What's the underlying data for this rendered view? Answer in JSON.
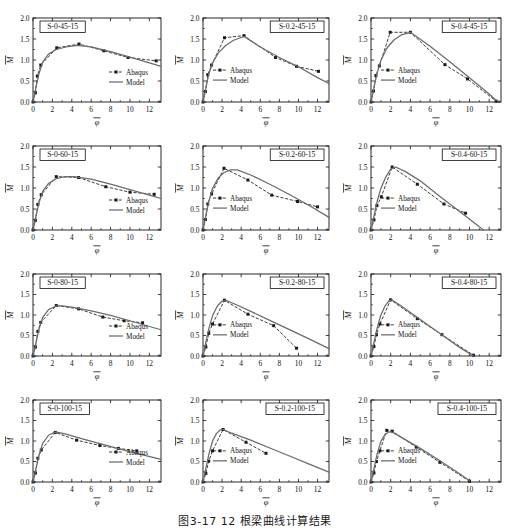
{
  "figure": {
    "caption": "图3-17  12 根梁曲线计算结果",
    "axis": {
      "x_label": "φ",
      "y_label": "M",
      "x_ticks": [
        0,
        2,
        4,
        6,
        8,
        10,
        12
      ],
      "y_ticks": [
        "0.0",
        "0.5",
        "1.0",
        "1.5",
        "2.0"
      ],
      "xlim": [
        0,
        13.2
      ],
      "ylim": [
        0,
        2.0
      ]
    },
    "legend": {
      "abaqus_label": "Abaqus",
      "model_label": "Model"
    },
    "colors": {
      "abaqus": "#1a1a1a",
      "model": "#6b6b6b",
      "axis": "#111111",
      "frame": "#111111"
    }
  },
  "chart_data": [
    {
      "type": "line",
      "title": "S-0-45-15",
      "xlabel": "φ",
      "ylabel": "M",
      "xlim": [
        0,
        13.2
      ],
      "ylim": [
        0,
        2.0
      ],
      "grid": false,
      "legend_position": "bottom-right",
      "series": [
        {
          "name": "Abaqus",
          "style": "dashed-markers",
          "x": [
            0.0,
            0.25,
            0.45,
            0.8,
            2.45,
            4.75,
            7.3,
            9.8,
            12.7
          ],
          "y": [
            0.0,
            0.22,
            0.62,
            0.88,
            1.29,
            1.38,
            1.22,
            1.06,
            0.98
          ]
        },
        {
          "name": "Model",
          "style": "solid",
          "x": [
            0.0,
            0.3,
            0.6,
            1.0,
            1.6,
            2.4,
            3.4,
            4.6,
            6.0,
            8.0,
            10.0,
            12.0,
            13.2
          ],
          "y": [
            0.0,
            0.34,
            0.66,
            0.95,
            1.14,
            1.25,
            1.31,
            1.35,
            1.31,
            1.2,
            1.07,
            0.93,
            0.85
          ]
        }
      ]
    },
    {
      "type": "line",
      "title": "S-0.2-45-15",
      "xlabel": "φ",
      "ylabel": "M",
      "xlim": [
        0,
        13.2
      ],
      "ylim": [
        0,
        2.0
      ],
      "grid": false,
      "legend_position": "center-left",
      "series": [
        {
          "name": "Abaqus",
          "style": "dashed-markers",
          "x": [
            0.0,
            0.25,
            0.5,
            0.9,
            2.25,
            4.3,
            7.6,
            9.8,
            12.1
          ],
          "y": [
            0.0,
            0.25,
            0.65,
            0.88,
            1.53,
            1.58,
            1.06,
            0.85,
            0.73
          ]
        },
        {
          "name": "Model",
          "style": "solid",
          "x": [
            0.0,
            0.3,
            0.6,
            1.0,
            1.6,
            2.4,
            3.2,
            4.3,
            6.0,
            8.0,
            10.0,
            12.0,
            13.2
          ],
          "y": [
            0.0,
            0.33,
            0.66,
            0.93,
            1.17,
            1.35,
            1.47,
            1.56,
            1.31,
            1.06,
            0.84,
            0.58,
            0.44
          ]
        }
      ]
    },
    {
      "type": "line",
      "title": "S-0.4-45-15",
      "xlabel": "φ",
      "ylabel": "M",
      "xlim": [
        0,
        13.2
      ],
      "ylim": [
        0,
        2.0
      ],
      "grid": false,
      "legend_position": "center-left",
      "series": [
        {
          "name": "Abaqus",
          "style": "dashed-markers",
          "x": [
            0.0,
            0.25,
            0.5,
            0.85,
            1.95,
            4.0,
            7.5,
            9.8,
            12.7
          ],
          "y": [
            0.0,
            0.26,
            0.63,
            0.86,
            1.66,
            1.66,
            0.89,
            0.55,
            0.02
          ]
        },
        {
          "name": "Model",
          "style": "solid",
          "x": [
            0.0,
            0.3,
            0.6,
            1.0,
            1.6,
            2.3,
            3.1,
            4.0,
            6.0,
            8.0,
            10.0,
            12.0,
            12.7
          ],
          "y": [
            0.0,
            0.34,
            0.67,
            0.99,
            1.28,
            1.47,
            1.6,
            1.66,
            1.33,
            0.96,
            0.58,
            0.19,
            0.04
          ]
        }
      ]
    },
    {
      "type": "line",
      "title": "S-0-60-15",
      "xlabel": "φ",
      "ylabel": "M",
      "xlim": [
        0,
        13.2
      ],
      "ylim": [
        0,
        2.0
      ],
      "grid": false,
      "legend_position": "bottom-right",
      "series": [
        {
          "name": "Abaqus",
          "style": "dashed-markers",
          "x": [
            0.0,
            0.25,
            0.5,
            0.85,
            2.4,
            4.7,
            7.5,
            10.0,
            12.5
          ],
          "y": [
            0.0,
            0.23,
            0.61,
            0.84,
            1.27,
            1.25,
            1.03,
            0.9,
            0.85
          ]
        },
        {
          "name": "Model",
          "style": "solid",
          "x": [
            0.0,
            0.3,
            0.6,
            1.0,
            1.6,
            2.4,
            3.3,
            4.2,
            6.0,
            8.0,
            10.0,
            12.0,
            13.2
          ],
          "y": [
            0.0,
            0.32,
            0.63,
            0.92,
            1.11,
            1.22,
            1.27,
            1.27,
            1.21,
            1.09,
            0.96,
            0.83,
            0.75
          ]
        }
      ]
    },
    {
      "type": "line",
      "title": "S-0.2-60-15",
      "xlabel": "φ",
      "ylabel": "M",
      "xlim": [
        0,
        13.2
      ],
      "ylim": [
        0,
        2.0
      ],
      "grid": false,
      "legend_position": "center-left",
      "series": [
        {
          "name": "Abaqus",
          "style": "dashed-markers",
          "x": [
            0.0,
            0.25,
            0.5,
            0.9,
            2.2,
            4.7,
            7.2,
            9.9,
            12.0
          ],
          "y": [
            0.0,
            0.25,
            0.62,
            0.86,
            1.47,
            1.19,
            0.83,
            0.68,
            0.55
          ]
        },
        {
          "name": "Model",
          "style": "solid",
          "x": [
            0.0,
            0.3,
            0.6,
            1.0,
            1.6,
            2.2,
            2.9,
            3.6,
            5.0,
            7.0,
            9.0,
            11.0,
            13.2
          ],
          "y": [
            0.0,
            0.34,
            0.67,
            0.99,
            1.24,
            1.37,
            1.43,
            1.43,
            1.31,
            1.09,
            0.85,
            0.6,
            0.3
          ]
        }
      ]
    },
    {
      "type": "line",
      "title": "S-0.4-60-15",
      "xlabel": "φ",
      "ylabel": "M",
      "xlim": [
        0,
        13.2
      ],
      "ylim": [
        0,
        2.0
      ],
      "grid": false,
      "legend_position": "center-left",
      "series": [
        {
          "name": "Abaqus",
          "style": "dashed-markers",
          "x": [
            0.0,
            0.3,
            0.6,
            1.05,
            2.15,
            4.7,
            7.4,
            9.6
          ],
          "y": [
            0.0,
            0.24,
            0.58,
            0.79,
            1.5,
            1.09,
            0.62,
            0.4
          ]
        },
        {
          "name": "Model",
          "style": "solid",
          "x": [
            0.0,
            0.3,
            0.6,
            1.0,
            1.5,
            2.0,
            2.5,
            3.5,
            5.0,
            7.0,
            9.0,
            11.0,
            11.4
          ],
          "y": [
            0.0,
            0.33,
            0.66,
            0.99,
            1.26,
            1.45,
            1.5,
            1.39,
            1.17,
            0.8,
            0.44,
            0.08,
            0.0
          ]
        }
      ]
    },
    {
      "type": "line",
      "title": "S-0-80-15",
      "xlabel": "φ",
      "ylabel": "M",
      "xlim": [
        0,
        13.2
      ],
      "ylim": [
        0,
        2.0
      ],
      "grid": false,
      "legend_position": "bottom-right",
      "series": [
        {
          "name": "Abaqus",
          "style": "dashed-markers",
          "x": [
            0.0,
            0.25,
            0.5,
            0.8,
            2.4,
            4.7,
            7.2,
            9.4,
            11.3
          ],
          "y": [
            0.0,
            0.22,
            0.6,
            0.82,
            1.23,
            1.15,
            0.95,
            0.86,
            0.81
          ]
        },
        {
          "name": "Model",
          "style": "solid",
          "x": [
            0.0,
            0.3,
            0.6,
            1.0,
            1.6,
            2.4,
            3.0,
            4.0,
            6.0,
            8.0,
            10.0,
            12.0,
            13.2
          ],
          "y": [
            0.0,
            0.32,
            0.64,
            0.94,
            1.13,
            1.22,
            1.22,
            1.19,
            1.1,
            0.99,
            0.86,
            0.72,
            0.64
          ]
        }
      ]
    },
    {
      "type": "line",
      "title": "S-0.2-80-15",
      "xlabel": "φ",
      "ylabel": "M",
      "xlim": [
        0,
        13.2
      ],
      "ylim": [
        0,
        2.0
      ],
      "grid": false,
      "legend_position": "center-left",
      "series": [
        {
          "name": "Abaqus",
          "style": "dashed-markers",
          "x": [
            0.0,
            0.3,
            0.6,
            1.0,
            2.25,
            4.7,
            7.4,
            9.8
          ],
          "y": [
            0.0,
            0.22,
            0.55,
            0.78,
            1.36,
            1.02,
            0.74,
            0.19
          ]
        },
        {
          "name": "Model",
          "style": "solid",
          "x": [
            0.0,
            0.3,
            0.6,
            1.0,
            1.5,
            2.0,
            2.4,
            3.5,
            5.0,
            7.0,
            9.0,
            11.0,
            13.2
          ],
          "y": [
            0.0,
            0.33,
            0.66,
            0.98,
            1.22,
            1.34,
            1.36,
            1.25,
            1.09,
            0.87,
            0.65,
            0.43,
            0.18
          ]
        }
      ]
    },
    {
      "type": "line",
      "title": "S-0.4-80-15",
      "xlabel": "φ",
      "ylabel": "M",
      "xlim": [
        0,
        13.2
      ],
      "ylim": [
        0,
        2.0
      ],
      "grid": false,
      "legend_position": "center-left",
      "series": [
        {
          "name": "Abaqus",
          "style": "dashed-markers",
          "x": [
            0.0,
            0.3,
            0.55,
            0.9,
            2.0,
            4.7,
            7.2,
            10.4
          ],
          "y": [
            0.0,
            0.23,
            0.52,
            0.78,
            1.37,
            0.91,
            0.52,
            0.02
          ]
        },
        {
          "name": "Model",
          "style": "solid",
          "x": [
            0.0,
            0.3,
            0.6,
            1.0,
            1.4,
            1.8,
            2.1,
            3.0,
            5.0,
            7.0,
            9.0,
            10.4
          ],
          "y": [
            0.0,
            0.33,
            0.66,
            1.0,
            1.21,
            1.34,
            1.37,
            1.23,
            0.89,
            0.55,
            0.21,
            0.0
          ]
        }
      ]
    },
    {
      "type": "line",
      "title": "S-0-100-15",
      "xlabel": "φ",
      "ylabel": "M",
      "xlim": [
        0,
        13.2
      ],
      "ylim": [
        0,
        2.0
      ],
      "grid": false,
      "legend_position": "bottom-right",
      "series": [
        {
          "name": "Abaqus",
          "style": "dashed-markers",
          "x": [
            0.0,
            0.25,
            0.5,
            0.85,
            2.3,
            4.5,
            6.9,
            8.8,
            10.7
          ],
          "y": [
            0.0,
            0.22,
            0.58,
            0.78,
            1.21,
            1.02,
            0.89,
            0.82,
            0.76
          ]
        },
        {
          "name": "Model",
          "style": "solid",
          "x": [
            0.0,
            0.3,
            0.6,
            1.0,
            1.6,
            2.2,
            2.6,
            3.5,
            5.0,
            7.0,
            9.0,
            11.0,
            13.2
          ],
          "y": [
            0.0,
            0.32,
            0.64,
            0.94,
            1.14,
            1.21,
            1.21,
            1.16,
            1.06,
            0.93,
            0.8,
            0.68,
            0.55
          ]
        }
      ]
    },
    {
      "type": "line",
      "title": "S-0.2-100-15",
      "xlabel": "φ",
      "ylabel": "M",
      "xlim": [
        0,
        13.2
      ],
      "ylim": [
        0,
        2.0
      ],
      "grid": false,
      "legend_position": "center-left",
      "series": [
        {
          "name": "Abaqus",
          "style": "dashed-markers",
          "x": [
            0.0,
            0.3,
            0.6,
            1.0,
            2.1,
            4.5,
            6.6
          ],
          "y": [
            0.0,
            0.21,
            0.51,
            0.76,
            1.28,
            0.97,
            0.7
          ]
        },
        {
          "name": "Model",
          "style": "solid",
          "x": [
            0.0,
            0.3,
            0.6,
            1.0,
            1.4,
            1.8,
            2.1,
            3.0,
            5.0,
            7.0,
            9.0,
            11.0,
            13.2
          ],
          "y": [
            0.0,
            0.33,
            0.66,
            1.0,
            1.18,
            1.27,
            1.28,
            1.19,
            1.02,
            0.83,
            0.64,
            0.45,
            0.24
          ]
        }
      ]
    },
    {
      "type": "line",
      "title": "S-0.4-100-15",
      "xlabel": "φ",
      "ylabel": "M",
      "xlim": [
        0,
        13.2
      ],
      "ylim": [
        0,
        2.0
      ],
      "grid": false,
      "legend_position": "center-left",
      "series": [
        {
          "name": "Abaqus",
          "style": "dashed-markers",
          "x": [
            0.0,
            0.3,
            0.55,
            0.9,
            1.6,
            2.15,
            4.6,
            7.0,
            10.0
          ],
          "y": [
            0.0,
            0.22,
            0.5,
            0.76,
            1.26,
            1.24,
            0.85,
            0.48,
            0.02
          ]
        },
        {
          "name": "Model",
          "style": "solid",
          "x": [
            0.0,
            0.3,
            0.6,
            1.0,
            1.4,
            1.8,
            2.1,
            3.0,
            5.0,
            7.0,
            9.0,
            10.0
          ],
          "y": [
            0.0,
            0.33,
            0.66,
            0.99,
            1.15,
            1.22,
            1.22,
            1.1,
            0.82,
            0.52,
            0.2,
            0.03
          ]
        }
      ]
    }
  ]
}
